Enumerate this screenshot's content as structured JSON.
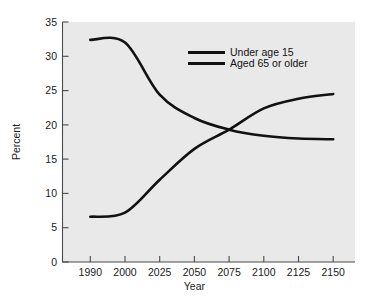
{
  "chart_data": {
    "type": "line",
    "title": "",
    "xlabel": "Year",
    "ylabel": "Percent",
    "xlim": [
      1990,
      2150
    ],
    "ylim": [
      0,
      35
    ],
    "grid": false,
    "legend_position": "top-center-right",
    "x_tick_labels": [
      "1990",
      "2000",
      "2025",
      "2050",
      "2075",
      "2100",
      "2125",
      "2150"
    ],
    "x_tick_values": [
      1990,
      2000,
      2025,
      2050,
      2075,
      2100,
      2125,
      2150
    ],
    "y_tick_labels": [
      "0",
      "5",
      "10",
      "15",
      "20",
      "25",
      "30",
      "35"
    ],
    "y_tick_values": [
      0,
      5,
      10,
      15,
      20,
      25,
      30,
      35
    ],
    "series": [
      {
        "name": "Under age 15",
        "color": "#111111",
        "x": [
          1990,
          2000,
          2025,
          2050,
          2075,
          2100,
          2125,
          2150
        ],
        "values": [
          32.4,
          32.0,
          24.4,
          21.0,
          19.3,
          18.4,
          18.0,
          17.9
        ]
      },
      {
        "name": "Aged 65 or older",
        "color": "#111111",
        "x": [
          1990,
          2000,
          2025,
          2050,
          2075,
          2100,
          2125,
          2150
        ],
        "values": [
          6.6,
          7.2,
          12.0,
          16.5,
          19.3,
          22.4,
          23.8,
          24.5
        ]
      }
    ]
  },
  "legend": {
    "entries": [
      {
        "label": "Under age 15"
      },
      {
        "label": "Aged 65 or older"
      }
    ]
  },
  "axes": {
    "y_title": "Percent",
    "x_title": "Year"
  },
  "colors": {
    "plot_background": "#e9e9e9",
    "page_background": "#ffffff",
    "line": "#111111",
    "axis": "#4a4a4a",
    "text": "#1a1a1a"
  }
}
